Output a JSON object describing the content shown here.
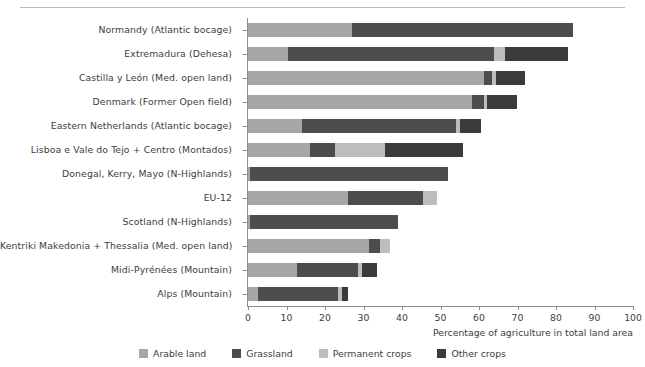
{
  "chart_data": {
    "type": "bar",
    "orientation": "horizontal",
    "stacked": true,
    "title": "",
    "xlabel": "Percentage of agriculture in total land area",
    "ylabel": "",
    "xlim": [
      0,
      100
    ],
    "xticks": [
      0,
      10,
      20,
      30,
      40,
      50,
      60,
      70,
      80,
      90,
      100
    ],
    "grid": false,
    "legend_position": "bottom-center",
    "series": [
      {
        "name": "Arable land",
        "color": "#a6a6a6",
        "values": [
          27.0,
          10.4,
          61.3,
          58.2,
          14.0,
          16.1,
          0.6,
          26.0,
          0.5,
          31.4,
          12.7,
          2.6
        ]
      },
      {
        "name": "Grassland",
        "color": "#4d4d4d",
        "values": [
          57.4,
          53.5,
          2.1,
          3.1,
          40.0,
          6.5,
          51.4,
          19.5,
          38.4,
          2.9,
          15.8,
          20.8
        ]
      },
      {
        "name": "Permanent crops",
        "color": "#bdbdbd",
        "values": [
          0.0,
          2.9,
          1.0,
          0.8,
          1.0,
          13.0,
          0.0,
          3.6,
          0.0,
          2.6,
          1.0,
          1.0
        ]
      },
      {
        "name": "Other crops",
        "color": "#3b3b3b",
        "values": [
          0.0,
          16.4,
          7.5,
          7.9,
          5.5,
          20.3,
          0.0,
          0.0,
          0.0,
          0.0,
          3.9,
          1.6
        ]
      }
    ],
    "categories": [
      "Normandy (Atlantic bocage)",
      "Extremadura (Dehesa)",
      "Castilla y León (Med. open land)",
      "Denmark (Former Open field)",
      "Eastern Netherlands (Atlantic bocage)",
      "Lisboa e Vale do Tejo + Centro (Montados)",
      "Donegal, Kerry, Mayo (N-Highlands)",
      "EU-12",
      "Scotland (N-Highlands)",
      "Kentriki Makedonia + Thessalia (Med. open land)",
      "Midi-Pyrénées (Mountain)",
      "Alps (Mountain)"
    ],
    "totals": [
      84.4,
      83.2,
      71.9,
      70.0,
      60.5,
      55.9,
      52.0,
      49.1,
      38.9,
      36.9,
      33.4,
      26.0
    ]
  },
  "axis": {
    "x_title": "Percentage of agriculture in total land area",
    "tick_labels": [
      "0",
      "10",
      "20",
      "30",
      "40",
      "50",
      "60",
      "70",
      "80",
      "90",
      "100"
    ]
  },
  "legend": {
    "items": [
      {
        "label": "Arable land",
        "color": "#a6a6a6"
      },
      {
        "label": "Grassland",
        "color": "#4d4d4d"
      },
      {
        "label": "Permanent crops",
        "color": "#bdbdbd"
      },
      {
        "label": "Other crops",
        "color": "#3b3b3b"
      }
    ]
  },
  "colors": {
    "arable": "#a6a6a6",
    "grassland": "#4d4d4d",
    "permanent": "#bdbdbd",
    "other": "#3b3b3b",
    "axis": "#8d8d8d",
    "text": "#3d3d3d",
    "rule": "#b9b9b9"
  }
}
